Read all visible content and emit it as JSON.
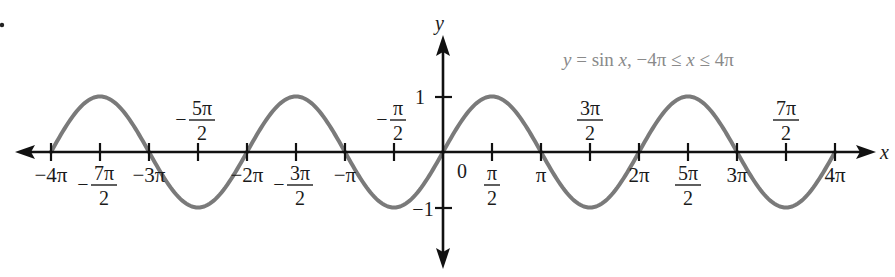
{
  "chart_data": {
    "type": "line",
    "title": "y = sin x, −4π ≤ x ≤ 4π",
    "xlabel": "x",
    "ylabel": "y",
    "xlim": [
      -12.566,
      12.566
    ],
    "ylim": [
      -1,
      1
    ],
    "grid": false,
    "legend": "none",
    "series": [
      {
        "name": "y = sin x",
        "color": "#7a7a7a",
        "function": "sin(x)",
        "x": [
          "-4π",
          "-7π/2",
          "-3π",
          "-5π/2",
          "-2π",
          "-3π/2",
          "-π",
          "-π/2",
          "0",
          "π/2",
          "π",
          "3π/2",
          "2π",
          "5π/2",
          "3π",
          "7π/2",
          "4π"
        ],
        "values": [
          0,
          1,
          0,
          -1,
          0,
          1,
          0,
          -1,
          0,
          1,
          0,
          -1,
          0,
          1,
          0,
          -1,
          0
        ]
      }
    ],
    "x_ticks": [
      {
        "value": -4,
        "label_num": "−4π",
        "den": "",
        "pos": "below"
      },
      {
        "value": -3.5,
        "label_num": "7π",
        "den": "2",
        "sign": "−",
        "pos": "below"
      },
      {
        "value": -3,
        "label_num": "−3π",
        "den": "",
        "pos": "below"
      },
      {
        "value": -2.5,
        "label_num": "5π",
        "den": "2",
        "sign": "−",
        "pos": "above"
      },
      {
        "value": -2,
        "label_num": "−2π",
        "den": "",
        "pos": "below"
      },
      {
        "value": -1.5,
        "label_num": "3π",
        "den": "2",
        "sign": "−",
        "pos": "below"
      },
      {
        "value": -1,
        "label_num": "−π",
        "den": "",
        "pos": "below"
      },
      {
        "value": -0.5,
        "label_num": "π",
        "den": "2",
        "sign": "−",
        "pos": "above"
      },
      {
        "value": 0.5,
        "label_num": "π",
        "den": "2",
        "sign": "",
        "pos": "below"
      },
      {
        "value": 1,
        "label_num": "π",
        "den": "",
        "pos": "below"
      },
      {
        "value": 1.5,
        "label_num": "3π",
        "den": "2",
        "sign": "",
        "pos": "above"
      },
      {
        "value": 2,
        "label_num": "2π",
        "den": "",
        "pos": "below"
      },
      {
        "value": 2.5,
        "label_num": "5π",
        "den": "2",
        "sign": "",
        "pos": "below"
      },
      {
        "value": 3,
        "label_num": "3π",
        "den": "",
        "pos": "below"
      },
      {
        "value": 3.5,
        "label_num": "7π",
        "den": "2",
        "sign": "",
        "pos": "above"
      },
      {
        "value": 4,
        "label_num": "4π",
        "den": "",
        "pos": "below"
      }
    ],
    "y_ticks": [
      {
        "value": 1,
        "label": "1"
      },
      {
        "value": -1,
        "label": "−1"
      }
    ],
    "origin_label": "0",
    "annotation": "y = sin x, −4π ≤ x ≤ 4π"
  },
  "labels": {
    "x_axis": "x",
    "y_axis": "y",
    "origin": "0",
    "y_one": "1",
    "y_neg_one": "−1",
    "equation_y": "y",
    "equation_eq": " = sin ",
    "equation_x": "x",
    "equation_range": ", −4π ≤ ",
    "equation_x2": "x",
    "equation_end": " ≤ 4π"
  }
}
